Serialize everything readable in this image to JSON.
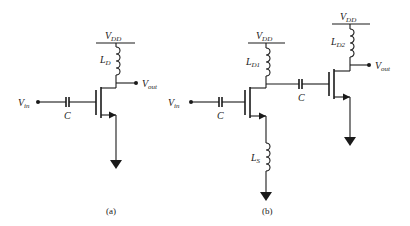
{
  "figure": {
    "panel_a": {
      "caption": "(a)",
      "vdd": {
        "main": "V",
        "sub": "DD"
      },
      "inductor": {
        "main": "L",
        "sub": "D"
      },
      "vout": {
        "main": "V",
        "sub": "out"
      },
      "vin": {
        "main": "V",
        "sub": "in"
      },
      "capacitor": "C"
    },
    "panel_b": {
      "caption": "(b)",
      "vdd1": {
        "main": "V",
        "sub": "DD"
      },
      "vdd2": {
        "main": "V",
        "sub": "DD"
      },
      "inductor_d1": {
        "main": "L",
        "sub": "D1"
      },
      "inductor_d2": {
        "main": "L",
        "sub": "D2"
      },
      "inductor_s": {
        "main": "L",
        "sub": "S"
      },
      "vin": {
        "main": "V",
        "sub": "in"
      },
      "vout": {
        "main": "V",
        "sub": "out"
      },
      "capacitor_in": "C",
      "capacitor_coupling": "C"
    }
  }
}
